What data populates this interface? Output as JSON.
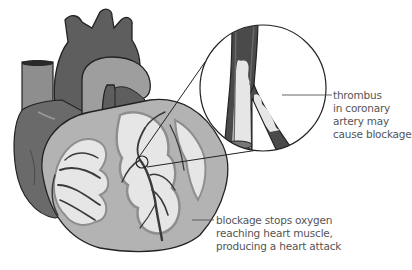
{
  "diagram": {
    "colors": {
      "dark_gray": "#5e5e5e",
      "mid_gray": "#8e8e8e",
      "light_gray": "#b3b3b3",
      "pale": "#e6e6e6",
      "outline": "#222222",
      "vessel": "#3a3a3a",
      "label_text": "#555555"
    },
    "labels": {
      "thrombus": {
        "lines": [
          "thrombus",
          "in coronary",
          "artery may",
          "cause blockage"
        ]
      },
      "blockage": {
        "lines": [
          "blockage stops oxygen",
          "reaching heart muscle,",
          "producing a heart attack"
        ]
      }
    },
    "inset": {
      "description": "magnified view of coronary artery branch with thrombus"
    }
  }
}
